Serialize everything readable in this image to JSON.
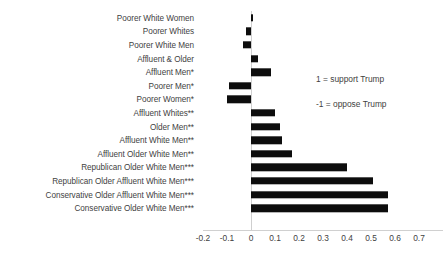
{
  "chart_data": {
    "type": "bar",
    "orientation": "horizontal",
    "title": "",
    "xlabel": "",
    "ylabel": "",
    "xlim": [
      -0.25,
      0.72
    ],
    "grid": false,
    "legend": null,
    "bar_color": "#0d0d0d",
    "categories": [
      "Poorer White Women",
      "Poorer Whites",
      "Poorer White Men",
      "Affluent & Older",
      "Affluent Men*",
      "Poorer Men*",
      "Poorer Women*",
      "Affluent Whites**",
      "Older Men**",
      "Affluent White Men**",
      "Affluent Older White Men**",
      "Republican Older White Men***",
      "Republican Older Affluent White Men***",
      "Conservative Older Affluent White Men***",
      "Conservative Older White Men***"
    ],
    "values": [
      0.005,
      -0.02,
      -0.035,
      0.03,
      0.085,
      -0.09,
      -0.1,
      0.1,
      0.12,
      0.13,
      0.17,
      0.4,
      0.51,
      0.57,
      0.57
    ],
    "xticks": [
      -0.2,
      -0.1,
      0,
      0.1,
      0.2,
      0.3,
      0.4,
      0.5,
      0.6,
      0.7
    ],
    "xtick_labels": [
      "-0.2",
      "-0.1",
      "0",
      "0.1",
      "0.2",
      "0.3",
      "0.4",
      "0.5",
      "0.6",
      "0.7"
    ],
    "annotations": [
      "1 = support Trump",
      "-1 = oppose Trump"
    ]
  }
}
